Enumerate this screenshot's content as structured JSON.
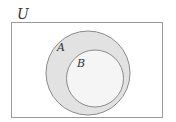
{
  "diagram": {
    "type": "venn",
    "universe": {
      "label": "U"
    },
    "sets": [
      {
        "label": "A",
        "fill": "#e2e2e2",
        "stroke": "#8a8a8a"
      },
      {
        "label": "B",
        "fill": "#f5f5f5",
        "stroke": "#8a8a8a",
        "subset_of": "A"
      }
    ],
    "colors": {
      "frame": "#9a9a9a",
      "background": "#ffffff"
    }
  }
}
